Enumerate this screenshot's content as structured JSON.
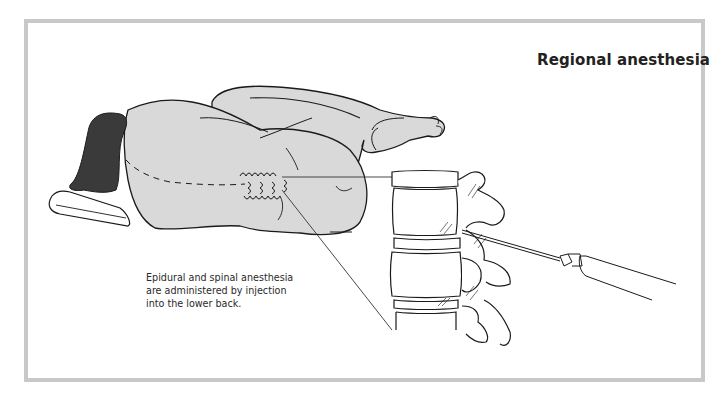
{
  "figure": {
    "title": "Regional anesthesia",
    "caption": "Epidural and spinal anesthesia are administered by injection into the lower back.",
    "illustration": {
      "subjects": [
        "patient-lying-on-side-curled",
        "pillow",
        "lumbar-spine-vertebrae",
        "syringe-needle"
      ],
      "colors": {
        "frame": "#c8c8c8",
        "skin": "#d9d9d9",
        "hair": "#3a3a3a",
        "line": "#1a1a1a"
      }
    }
  }
}
